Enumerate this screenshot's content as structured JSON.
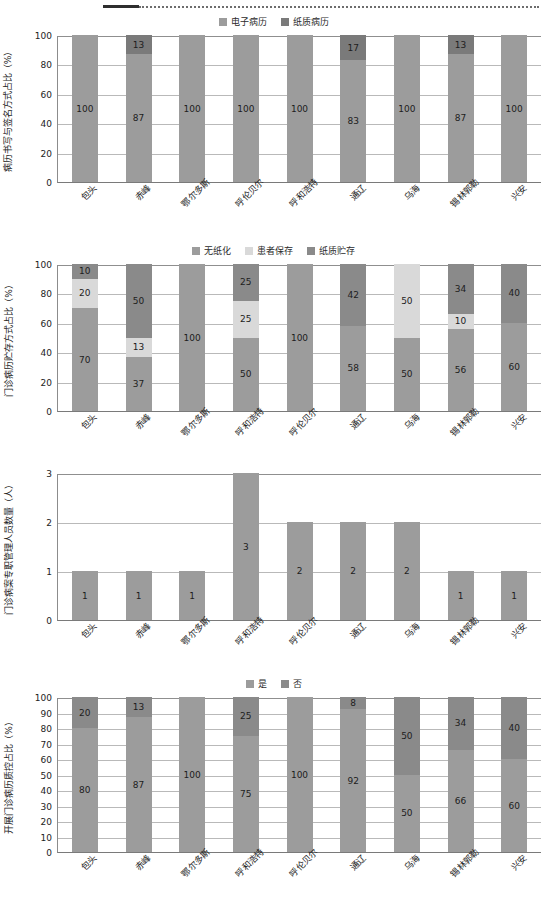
{
  "decoration": {
    "rule": "dotted-rule"
  },
  "charts": [
    {
      "id": "chart-1",
      "ylabel": "病历书写与签名方式占比（%）",
      "legend": [
        {
          "label": "电子病历",
          "color": "#9c9c9c"
        },
        {
          "label": "纸质病历",
          "color": "#7a7a7a"
        }
      ],
      "categories": [
        "包头",
        "赤峰",
        "鄂尔多斯",
        "呼伦贝尔",
        "呼和浩特",
        "通辽",
        "乌海",
        "锡林郭勒",
        "兴安"
      ],
      "yticks": [
        "0",
        "20",
        "40",
        "60",
        "80",
        "100"
      ],
      "chart_data": {
        "type": "bar",
        "title": "",
        "xlabel": "",
        "ylabel": "病历书写与签名方式占比（%）",
        "ylim": [
          0,
          100
        ],
        "grid": true,
        "legend_position": "top-center",
        "stacked": true,
        "categories": [
          "包头",
          "赤峰",
          "鄂尔多斯",
          "呼伦贝尔",
          "呼和浩特",
          "通辽",
          "乌海",
          "锡林郭勒",
          "兴安"
        ],
        "series": [
          {
            "name": "电子病历",
            "color": "#9c9c9c",
            "values": [
              100,
              87,
              100,
              100,
              100,
              83,
              100,
              87,
              100
            ]
          },
          {
            "name": "纸质病历",
            "color": "#7a7a7a",
            "values": [
              0,
              13,
              0,
              0,
              0,
              17,
              0,
              13,
              0
            ]
          }
        ]
      }
    },
    {
      "id": "chart-2",
      "ylabel": "门诊病历贮存方式占比（%）",
      "legend": [
        {
          "label": "无纸化",
          "color": "#9c9c9c"
        },
        {
          "label": "患者保存",
          "color": "#d9d9d9"
        },
        {
          "label": "纸质贮存",
          "color": "#8a8a8a"
        }
      ],
      "categories": [
        "包头",
        "赤峰",
        "鄂尔多斯",
        "呼和浩特",
        "呼伦贝尔",
        "通辽",
        "乌海",
        "锡林郭勒",
        "兴安"
      ],
      "yticks": [
        "0",
        "20",
        "40",
        "60",
        "80",
        "100"
      ],
      "chart_data": {
        "type": "bar",
        "title": "",
        "xlabel": "",
        "ylabel": "门诊病历贮存方式占比（%）",
        "ylim": [
          0,
          100
        ],
        "grid": true,
        "legend_position": "top-center",
        "stacked": true,
        "categories": [
          "包头",
          "赤峰",
          "鄂尔多斯",
          "呼和浩特",
          "呼伦贝尔",
          "通辽",
          "乌海",
          "锡林郭勒",
          "兴安"
        ],
        "series": [
          {
            "name": "无纸化",
            "color": "#9c9c9c",
            "values": [
              70,
              37,
              100,
              50,
              100,
              58,
              50,
              56,
              60
            ]
          },
          {
            "name": "患者保存",
            "color": "#d9d9d9",
            "values": [
              20,
              13,
              0,
              25,
              0,
              0,
              50,
              10,
              0
            ]
          },
          {
            "name": "纸质贮存",
            "color": "#8a8a8a",
            "values": [
              10,
              50,
              0,
              25,
              0,
              42,
              0,
              34,
              40
            ]
          }
        ]
      }
    },
    {
      "id": "chart-3",
      "ylabel": "门诊病案专职管理人员数量（人）",
      "legend": [],
      "categories": [
        "包头",
        "赤峰",
        "鄂尔多斯",
        "呼和浩特",
        "呼伦贝尔",
        "通辽",
        "乌海",
        "锡林郭勒",
        "兴安"
      ],
      "yticks": [
        "0",
        "1",
        "2",
        "3"
      ],
      "chart_data": {
        "type": "bar",
        "title": "",
        "xlabel": "",
        "ylabel": "门诊病案专职管理人员数量（人）",
        "ylim": [
          0,
          3
        ],
        "grid": true,
        "legend_position": "none",
        "stacked": false,
        "categories": [
          "包头",
          "赤峰",
          "鄂尔多斯",
          "呼和浩特",
          "呼伦贝尔",
          "通辽",
          "乌海",
          "锡林郭勒",
          "兴安"
        ],
        "series": [
          {
            "name": "人员数量",
            "color": "#9c9c9c",
            "values": [
              1,
              1,
              1,
              3,
              2,
              2,
              2,
              1,
              1
            ]
          }
        ]
      }
    },
    {
      "id": "chart-4",
      "ylabel": "开展门诊病历质控占比（%）",
      "legend": [
        {
          "label": "是",
          "color": "#9c9c9c"
        },
        {
          "label": "否",
          "color": "#8a8a8a"
        }
      ],
      "categories": [
        "包头",
        "赤峰",
        "鄂尔多斯",
        "呼和浩特",
        "呼伦贝尔",
        "通辽",
        "乌海",
        "锡林郭勒",
        "兴安"
      ],
      "yticks": [
        "0",
        "10",
        "20",
        "30",
        "40",
        "50",
        "60",
        "70",
        "80",
        "90",
        "100"
      ],
      "chart_data": {
        "type": "bar",
        "title": "",
        "xlabel": "",
        "ylabel": "开展门诊病历质控占比（%）",
        "ylim": [
          0,
          100
        ],
        "grid": true,
        "legend_position": "top-center",
        "stacked": true,
        "categories": [
          "包头",
          "赤峰",
          "鄂尔多斯",
          "呼和浩特",
          "呼伦贝尔",
          "通辽",
          "乌海",
          "锡林郭勒",
          "兴安"
        ],
        "series": [
          {
            "name": "是",
            "color": "#9c9c9c",
            "values": [
              80,
              87,
              100,
              75,
              100,
              92,
              50,
              66,
              60
            ]
          },
          {
            "name": "否",
            "color": "#8a8a8a",
            "values": [
              20,
              13,
              0,
              25,
              0,
              8,
              50,
              34,
              40
            ]
          }
        ]
      }
    }
  ]
}
